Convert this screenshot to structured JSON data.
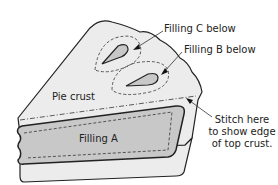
{
  "diagram": {
    "labels": {
      "filling_c": "Filling C below",
      "filling_b": "Filling B below",
      "pie_crust": "Pie crust",
      "filling_a": "Filling A",
      "stitch_line1": "Stitch here",
      "stitch_line2": "to show edge",
      "stitch_line3": "of top crust."
    },
    "colors": {
      "crust": "#ececec",
      "filling": "#c8c8c8",
      "outline": "#222222",
      "background": "#ffffff"
    }
  }
}
